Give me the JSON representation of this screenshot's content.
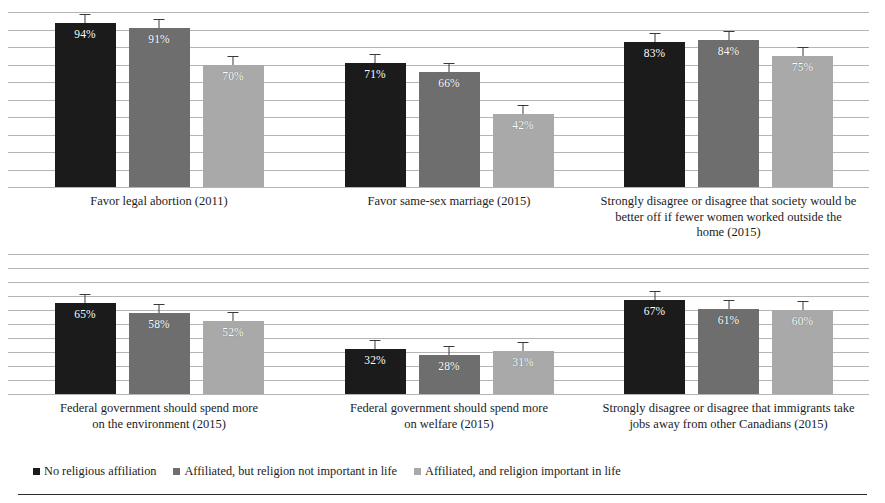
{
  "chart_data": {
    "type": "bar",
    "title": "",
    "xlabel": "",
    "ylabel": "",
    "ylim": [
      0,
      100
    ],
    "grid": true,
    "gridline_count": 11,
    "gridline_step": 10,
    "legend_position": "bottom-left",
    "value_suffix": "%",
    "error_bars": true,
    "categories": [
      "Favor legal abortion (2011)",
      "Favor same-sex marriage (2015)",
      "Strongly disagree or disagree that society would be better off if fewer women worked outside the home (2015)",
      "Federal government should spend more on the environment (2015)",
      "Federal government should spend more on welfare (2015)",
      "Strongly disagree or disagree that immigrants take jobs away from other Canadians (2015)"
    ],
    "series": [
      {
        "name": "No religious affiliation",
        "color": "#1b1b1b",
        "values": [
          94,
          71,
          83,
          65,
          32,
          67
        ]
      },
      {
        "name": "Affiliated, but religion not important in life",
        "color": "#6e6e6e",
        "values": [
          91,
          66,
          84,
          58,
          28,
          61
        ]
      },
      {
        "name": "Affiliated, and religion important in life",
        "color": "#a9a9a9",
        "values": [
          70,
          42,
          75,
          52,
          31,
          60
        ]
      }
    ],
    "panels": [
      {
        "id": "abortion",
        "caption_lines": [
          "Favor legal abortion (2011)"
        ],
        "bars": [
          {
            "series": "No religious affiliation",
            "value": 94,
            "label": "94%",
            "color": "#1b1b1b"
          },
          {
            "series": "Affiliated, but religion not important in life",
            "value": 91,
            "label": "91%",
            "color": "#6e6e6e"
          },
          {
            "series": "Affiliated, and religion important in life",
            "value": 70,
            "label": "70%",
            "color": "#a9a9a9"
          }
        ]
      },
      {
        "id": "same-sex-marriage",
        "caption_lines": [
          "Favor same-sex marriage (2015)"
        ],
        "bars": [
          {
            "series": "No religious affiliation",
            "value": 71,
            "label": "71%",
            "color": "#1b1b1b"
          },
          {
            "series": "Affiliated, but religion not important in life",
            "value": 66,
            "label": "66%",
            "color": "#6e6e6e"
          },
          {
            "series": "Affiliated, and religion important in life",
            "value": 42,
            "label": "42%",
            "color": "#a9a9a9"
          }
        ]
      },
      {
        "id": "women-working-outside-home",
        "caption_lines": [
          "Strongly disagree or disagree that society would be",
          "better off if fewer women worked outside the",
          "home (2015)"
        ],
        "bars": [
          {
            "series": "No religious affiliation",
            "value": 83,
            "label": "83%",
            "color": "#1b1b1b"
          },
          {
            "series": "Affiliated, but religion not important in life",
            "value": 84,
            "label": "84%",
            "color": "#6e6e6e"
          },
          {
            "series": "Affiliated, and religion important in life",
            "value": 75,
            "label": "75%",
            "color": "#a9a9a9"
          }
        ]
      },
      {
        "id": "spend-environment",
        "caption_lines": [
          "Federal government should spend more",
          "on the environment (2015)"
        ],
        "bars": [
          {
            "series": "No religious affiliation",
            "value": 65,
            "label": "65%",
            "color": "#1b1b1b"
          },
          {
            "series": "Affiliated, but religion not important in life",
            "value": 58,
            "label": "58%",
            "color": "#6e6e6e"
          },
          {
            "series": "Affiliated, and religion important in life",
            "value": 52,
            "label": "52%",
            "color": "#a9a9a9"
          }
        ]
      },
      {
        "id": "spend-welfare",
        "caption_lines": [
          "Federal government should spend more",
          "on welfare (2015)"
        ],
        "bars": [
          {
            "series": "No religious affiliation",
            "value": 32,
            "label": "32%",
            "color": "#1b1b1b"
          },
          {
            "series": "Affiliated, but religion not important in life",
            "value": 28,
            "label": "28%",
            "color": "#6e6e6e"
          },
          {
            "series": "Affiliated, and religion important in life",
            "value": 31,
            "label": "31%",
            "color": "#a9a9a9"
          }
        ]
      },
      {
        "id": "immigrants-jobs",
        "caption_lines": [
          "Strongly disagree or disagree that immigrants take",
          "jobs away from other Canadians (2015)"
        ],
        "bars": [
          {
            "series": "No religious affiliation",
            "value": 67,
            "label": "67%",
            "color": "#1b1b1b"
          },
          {
            "series": "Affiliated, but religion not important in life",
            "value": 61,
            "label": "61%",
            "color": "#6e6e6e"
          },
          {
            "series": "Affiliated, and religion important in life",
            "value": 60,
            "label": "60%",
            "color": "#a9a9a9"
          }
        ]
      }
    ]
  },
  "legend": {
    "items": [
      {
        "label": "No religious affiliation",
        "color": "#1b1b1b"
      },
      {
        "label": "Affiliated, but religion not important in life",
        "color": "#6e6e6e"
      },
      {
        "label": "Affiliated, and religion important in life",
        "color": "#a9a9a9"
      }
    ]
  },
  "footnote": {
    "visible_text": ""
  }
}
